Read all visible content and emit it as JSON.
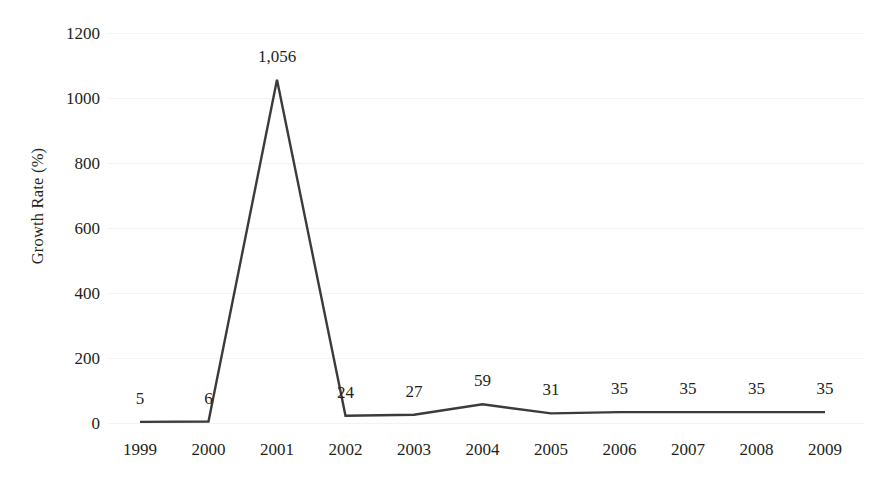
{
  "chart_data": {
    "type": "line",
    "title": "",
    "subtitle": "",
    "xlabel": "",
    "ylabel": "Growth Rate (%)",
    "categories": [
      "1999",
      "2000",
      "2001",
      "2002",
      "2003",
      "2004",
      "2005",
      "2006",
      "2007",
      "2008",
      "2009"
    ],
    "values": [
      5,
      6,
      1056,
      24,
      27,
      59,
      31,
      35,
      35,
      35,
      35
    ],
    "point_labels": [
      "5",
      "6",
      "1,056",
      "24",
      "27",
      "59",
      "31",
      "35",
      "35",
      "35",
      "35"
    ],
    "ylim": [
      0,
      1200
    ],
    "yticks": [
      0,
      200,
      400,
      600,
      800,
      1000,
      1200
    ],
    "ytick_labels": [
      "0",
      "200",
      "400",
      "600",
      "800",
      "1000",
      "1200"
    ],
    "grid": false,
    "legend": "none",
    "series": [
      {
        "name": "Growth Rate (%)",
        "color": "#3b3b3d",
        "values": [
          5,
          6,
          1056,
          24,
          27,
          59,
          31,
          35,
          35,
          35,
          35
        ]
      }
    ],
    "line_color": "#3b3b3d",
    "background_color": "#ffffff",
    "text_color": "#231f20"
  }
}
